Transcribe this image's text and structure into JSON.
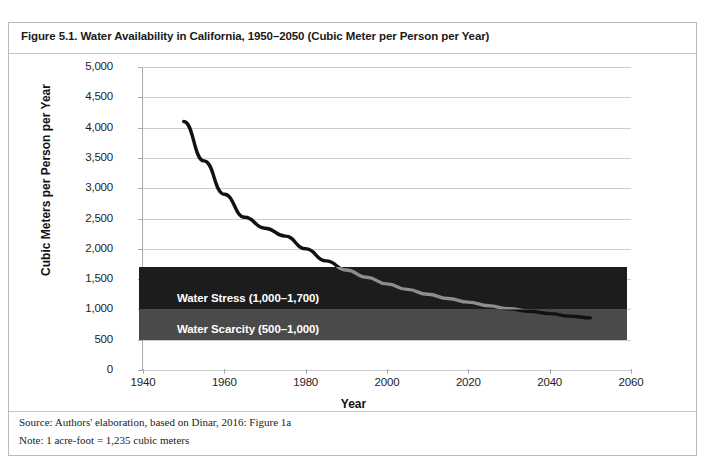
{
  "figure": {
    "title": "Figure 5.1. Water Availability in California, 1950–2050 (Cubic Meter per Person per Year)",
    "source": "Source: Authors' elaboration, based on Dinar, 2016: Figure 1a",
    "note": "Note: 1 acre-foot = 1,235 cubic meters"
  },
  "chart_data": {
    "type": "line",
    "title": "Water Availability in California, 1950–2050 (Cubic Meter per Person per Year)",
    "xlabel": "Year",
    "ylabel": "Cubic Meters per Person per Year",
    "xlim": [
      1940,
      2060
    ],
    "ylim": [
      0,
      5000
    ],
    "grid": true,
    "legend": null,
    "x_ticks": [
      "1940",
      "1960",
      "1980",
      "2000",
      "2020",
      "2040",
      "2060"
    ],
    "x_tick_values": [
      1940,
      1960,
      1980,
      2000,
      2020,
      2040,
      2060
    ],
    "y_ticks": [
      "0",
      "500",
      "1,000",
      "1,500",
      "2,000",
      "2,500",
      "3,000",
      "3,500",
      "4,000",
      "4,500",
      "5,000"
    ],
    "y_tick_values": [
      0,
      500,
      1000,
      1500,
      2000,
      2500,
      3000,
      3500,
      4000,
      4500,
      5000
    ],
    "series": [
      {
        "name": "Water availability per person",
        "color": "#111111",
        "x": [
          1950,
          1955,
          1960,
          1965,
          1970,
          1975,
          1980,
          1985,
          1990,
          1995,
          2000,
          2005,
          2010,
          2015,
          2020,
          2025,
          2030,
          2035,
          2040,
          2045,
          2050
        ],
        "values": [
          4100,
          3450,
          2900,
          2520,
          2340,
          2210,
          2000,
          1800,
          1650,
          1530,
          1420,
          1330,
          1250,
          1180,
          1120,
          1060,
          1010,
          970,
          930,
          890,
          860
        ]
      }
    ],
    "bands": [
      {
        "name": "Water Stress",
        "label": "Water Stress (1,000–1,700)",
        "min": 1000,
        "max": 1700,
        "color": "#1c1c1c",
        "text_color": "#ffffff"
      },
      {
        "name": "Water Scarcity",
        "label": "Water Scarcity (500–1,000)",
        "min": 500,
        "max": 1000,
        "color": "#4a4a4a",
        "text_color": "#ffffff"
      }
    ],
    "band_x_range": [
      1939,
      2059
    ]
  }
}
